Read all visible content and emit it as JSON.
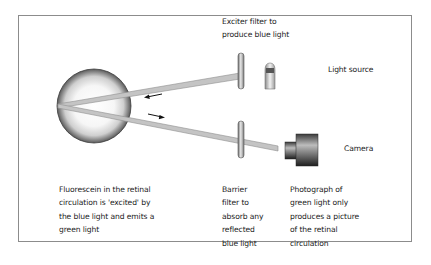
{
  "diagram": {
    "labels": {
      "exciter_filter": "Exciter filter to\nproduce blue light",
      "light_source": "Light source",
      "camera": "Camera",
      "fluorescein": "Fluorescein in the retinal\ncirculation is 'excited' by\nthe blue light and emits a\ngreen light",
      "barrier_filter": "Barrier\nfilter to\nabsorb any\nreflected\nblue light",
      "photograph": "Photograph of\ngreen light only\nproduces a picture\nof the retinal\ncirculation"
    },
    "components": [
      "eye",
      "exciter-filter",
      "light-source",
      "barrier-filter",
      "camera",
      "incoming-arrow",
      "outgoing-arrow"
    ],
    "colors": {
      "frame": "#8c8c8c",
      "beam": "#bdbdbd",
      "beam_edge": "#8f8f8f"
    }
  }
}
